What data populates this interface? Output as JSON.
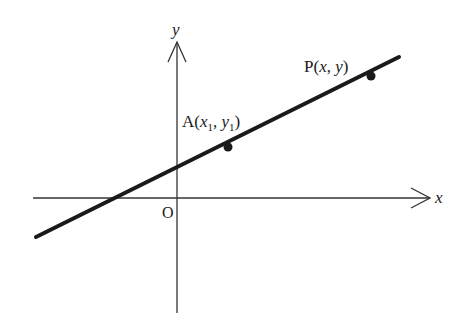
{
  "diagram": {
    "type": "coordinate-plane-line",
    "axes": {
      "x_label": "x",
      "y_label": "y",
      "origin_label": "O"
    },
    "points": [
      {
        "id": "A",
        "label_prefix": "A(",
        "x_var": "x",
        "x_sub": "1",
        "sep": ", ",
        "y_var": "y",
        "y_sub": "1",
        "label_suffix": ")"
      },
      {
        "id": "P",
        "label_prefix": "P(",
        "x_var": "x",
        "sep": ", ",
        "y_var": "y",
        "label_suffix": ")"
      }
    ],
    "colors": {
      "line": "#1a1a1a",
      "axes": "#333333",
      "background": "#ffffff"
    }
  }
}
